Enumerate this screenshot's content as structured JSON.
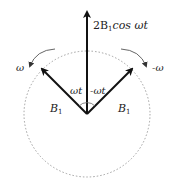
{
  "diagram": {
    "center": {
      "x": 87,
      "y": 114
    },
    "circle": {
      "radius": 63,
      "style": "dotted",
      "color": "#999999"
    },
    "vectors": [
      {
        "id": "resultant",
        "label_main": "2B",
        "label_sub": "1",
        "label_suffix": "cos ωt",
        "to": {
          "x": 87,
          "y": 10
        }
      },
      {
        "id": "left",
        "label_main": "B",
        "label_sub": "1",
        "to": {
          "x": 40,
          "y": 67
        }
      },
      {
        "id": "right",
        "label_main": "B",
        "label_sub": "1",
        "to": {
          "x": 134,
          "y": 67
        }
      }
    ],
    "angles": {
      "left": "ωt",
      "right": "-ωt"
    },
    "rotations": {
      "left": "ω",
      "right": "-ω"
    },
    "colors": {
      "vector": "#111111",
      "circle": "#999999",
      "rotation_arrow": "#555555"
    }
  }
}
